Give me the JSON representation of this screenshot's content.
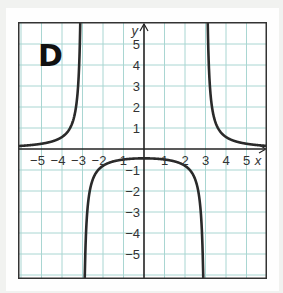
{
  "panel": {
    "label": "D"
  },
  "axes": {
    "x_label": "x",
    "y_label": "y",
    "x_ticks": [
      "−5",
      "−4",
      "−3",
      "−2",
      "−1",
      "1",
      "2",
      "3",
      "4",
      "5"
    ],
    "y_ticks": [
      "5",
      "4",
      "3",
      "2",
      "1",
      "−1",
      "−2",
      "−3",
      "−4",
      "−5"
    ]
  },
  "colors": {
    "grid": "#a9d6d2",
    "axis": "#222222",
    "curve": "#2a2a2a",
    "frame": "#333333"
  },
  "chart_data": {
    "type": "line",
    "title": "D",
    "xlabel": "x",
    "ylabel": "y",
    "xlim": [
      -6,
      6
    ],
    "ylim": [
      -6,
      6
    ],
    "grid": true,
    "legend": null,
    "function": "y = 4/(x^2 - 9)",
    "asymptotes": {
      "vertical": [
        -3,
        3
      ],
      "horizontal": [
        0
      ]
    },
    "series": [
      {
        "name": "left branch",
        "x": [
          -6,
          -5.5,
          -5,
          -4.5,
          -4,
          -3.5,
          -3.3,
          -3.2,
          -3.1
        ],
        "y": [
          0.15,
          0.19,
          0.25,
          0.36,
          0.57,
          1.23,
          2.1,
          3.23,
          6.56
        ]
      },
      {
        "name": "middle branch",
        "x": [
          -2.95,
          -2.9,
          -2.8,
          -2.5,
          -2,
          -1,
          0,
          1,
          2,
          2.5,
          2.8,
          2.9,
          2.95
        ],
        "y": [
          -6.77,
          -3.93,
          -3.45,
          -1.45,
          -0.8,
          -0.5,
          -0.44,
          -0.5,
          -0.8,
          -1.45,
          -3.45,
          -3.93,
          -6.77
        ]
      },
      {
        "name": "right branch",
        "x": [
          3.1,
          3.2,
          3.3,
          3.5,
          4,
          4.5,
          5,
          5.5,
          6
        ],
        "y": [
          6.56,
          3.23,
          2.1,
          1.23,
          0.57,
          0.36,
          0.25,
          0.19,
          0.15
        ]
      }
    ]
  }
}
